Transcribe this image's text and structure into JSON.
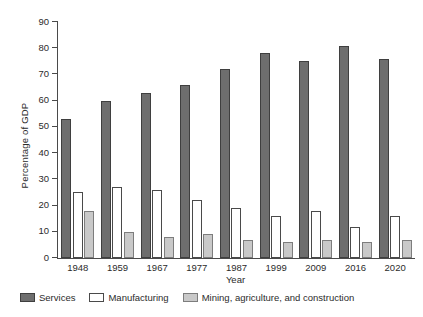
{
  "chart_data": {
    "type": "bar",
    "title": "",
    "xlabel": "Year",
    "ylabel": "Percentage of GDP",
    "categories": [
      "1948",
      "1959",
      "1967",
      "1977",
      "1987",
      "1999",
      "2009",
      "2016",
      "2020"
    ],
    "ylim": [
      0,
      90
    ],
    "yticks": [
      0,
      10,
      20,
      30,
      40,
      50,
      60,
      70,
      80,
      90
    ],
    "grid": false,
    "legend_position": "bottom-left",
    "series": [
      {
        "name": "Services",
        "color": "#6e6e6e",
        "values": [
          53,
          60,
          63,
          66,
          72,
          78,
          75,
          81,
          76
        ]
      },
      {
        "name": "Manufacturing",
        "color": "#ffffff",
        "values": [
          25,
          27,
          26,
          22,
          19,
          16,
          18,
          12,
          16
        ]
      },
      {
        "name": "Mining, agriculture, and construction",
        "color": "#c9c9c9",
        "values": [
          18,
          10,
          8,
          9,
          7,
          6,
          7,
          6,
          7
        ]
      }
    ]
  }
}
